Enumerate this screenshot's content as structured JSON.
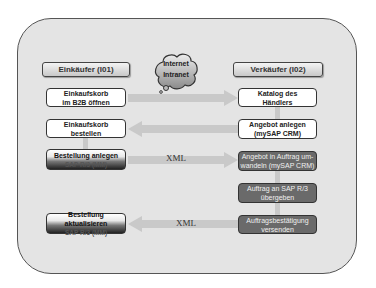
{
  "diagram": {
    "headers": {
      "buyer": "Einkäufer (I01)",
      "seller": "Verkäufer (I02)"
    },
    "network_cloud": {
      "line1": "Internet",
      "line2": "Intranet"
    },
    "buyer_steps": [
      {
        "line1": "Einkaufskorb",
        "line2": "im B2B öffnen"
      },
      {
        "line1": "Einkaufskorb",
        "line2": "bestellen"
      },
      {
        "line1": "Bestellung anlegen",
        "line2": "SAP R/3 (MM)"
      },
      {
        "line1": "Bestellung aktualisieren",
        "line2": "SAP R/3 (MM)"
      }
    ],
    "seller_steps": [
      {
        "line1": "Katalog des",
        "line2": "Händlers"
      },
      {
        "line1": "Angebot anlegen",
        "line2": "(mySAP CRM)"
      },
      {
        "line1": "Angebot in Auftrag um-",
        "line2": "wandeln (mySAP CRM)"
      },
      {
        "line1": "Auftrag an SAP R/3",
        "line2": "übergeben"
      },
      {
        "line1": "Auftragsbestätigung",
        "line2": "versenden"
      }
    ],
    "flow_labels": {
      "order_xml": "XML",
      "confirmation_xml": "XML"
    },
    "colors": {
      "panel_bg": "#e4e4e4",
      "arrow": "#c8c8c8",
      "dark_box": "#6a6a6a"
    }
  }
}
